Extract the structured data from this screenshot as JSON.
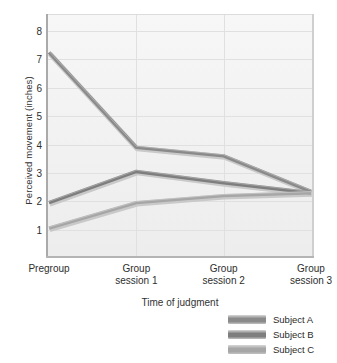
{
  "chart_data": {
    "type": "line",
    "title": "",
    "xlabel": "Time of judgment",
    "ylabel": "Perceived movement (inches)",
    "categories": [
      "Pregroup",
      "Group session 1",
      "Group session 2",
      "Group session 3"
    ],
    "category_lines": [
      [
        "Pregroup",
        ""
      ],
      [
        "Group",
        "session 1"
      ],
      [
        "Group",
        "session 2"
      ],
      [
        "Group",
        "session 3"
      ]
    ],
    "series": [
      {
        "name": "Subject A",
        "values": [
          7.25,
          3.9,
          3.6,
          2.35
        ],
        "color": "#8a8a8a"
      },
      {
        "name": "Subject B",
        "values": [
          1.95,
          3.05,
          2.65,
          2.3
        ],
        "color": "#7e7e7e"
      },
      {
        "name": "Subject C",
        "values": [
          1.05,
          1.95,
          2.2,
          2.3
        ],
        "color": "#a6a6a6"
      }
    ],
    "ylim": [
      0,
      8.6
    ],
    "yticks": [
      1,
      2,
      3,
      4,
      5,
      6,
      7,
      8
    ],
    "ytick_labels": [
      "1",
      "2",
      "3",
      "4",
      "5",
      "6",
      "7",
      "8"
    ],
    "xlim_index": [
      0,
      3
    ],
    "grid": true,
    "legend_position": "bottom-right",
    "plot_background": "#f3f3f3",
    "gridline_color": "#e0e0e0",
    "axis_color": "#aaaaaa"
  }
}
